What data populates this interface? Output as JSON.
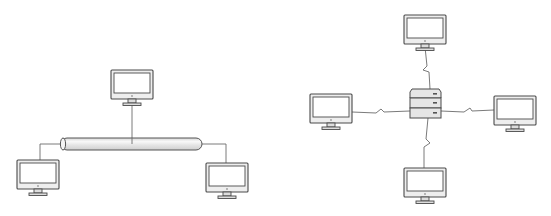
{
  "diagram": {
    "left": {
      "topology": "bus",
      "bus": {
        "x1": 61,
        "x2": 202,
        "y": 144,
        "h": 12
      },
      "computers": [
        {
          "id": "bus-pc-top",
          "x": 111,
          "y": 70,
          "tap_x": 132,
          "tap_y": 144
        },
        {
          "id": "bus-pc-left",
          "x": 17,
          "y": 160,
          "tap_x": 61,
          "tap_y": 144
        },
        {
          "id": "bus-pc-right",
          "x": 206,
          "y": 163,
          "tap_x": 202,
          "tap_y": 144
        }
      ]
    },
    "right": {
      "topology": "star",
      "server": {
        "x": 410,
        "y": 89,
        "w": 31,
        "h": 29
      },
      "computers": [
        {
          "id": "star-pc-top",
          "x": 404,
          "y": 15
        },
        {
          "id": "star-pc-left",
          "x": 310,
          "y": 94
        },
        {
          "id": "star-pc-right",
          "x": 494,
          "y": 96
        },
        {
          "id": "star-pc-bottom",
          "x": 404,
          "y": 168
        }
      ],
      "links": [
        {
          "id": "link-top",
          "points": "425,47 427,66 423,70 429,72 430,89"
        },
        {
          "id": "link-left",
          "points": "352,112 376,113 381,109 384,112 410,111"
        },
        {
          "id": "link-right",
          "points": "441,111 464,112 470,108 472,111 494,110"
        },
        {
          "id": "link-bottom",
          "points": "428,118 426,139 430,143 424,147 424,168"
        }
      ]
    }
  }
}
